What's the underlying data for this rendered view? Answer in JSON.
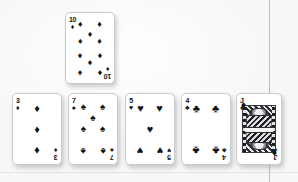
{
  "scene": {
    "description": "Playing cards laid out on a light surface",
    "background_color": "#fdfdfd",
    "guide_line_color": "#b9bcc0"
  },
  "suit_glyphs": {
    "diamonds": "♦",
    "spades": "♠",
    "hearts": "♥",
    "clubs": "♣"
  },
  "cards": [
    {
      "id": "card-top-10-diamonds",
      "rank": "10",
      "suit": "diamonds",
      "suit_symbol": "♦",
      "color": "#121316",
      "row": "top",
      "position": {
        "x": 65,
        "y": 12,
        "w": 50,
        "h": 72
      },
      "pip_layout": "10",
      "is_court": false
    },
    {
      "id": "card-bottom-3-diamonds",
      "rank": "3",
      "suit": "diamonds",
      "suit_symbol": "♦",
      "color": "#121316",
      "row": "bottom",
      "position": {
        "x": 12,
        "y": 93,
        "w": 50,
        "h": 72
      },
      "pip_layout": "3",
      "is_court": false
    },
    {
      "id": "card-bottom-7-spades",
      "rank": "7",
      "suit": "spades",
      "suit_symbol": "♠",
      "color": "#111214",
      "row": "bottom",
      "position": {
        "x": 68,
        "y": 93,
        "w": 50,
        "h": 72
      },
      "pip_layout": "7",
      "is_court": false
    },
    {
      "id": "card-bottom-5-hearts",
      "rank": "5",
      "suit": "hearts",
      "suit_symbol": "♥",
      "color": "#121316",
      "row": "bottom",
      "position": {
        "x": 125,
        "y": 93,
        "w": 50,
        "h": 72
      },
      "pip_layout": "5",
      "is_court": false
    },
    {
      "id": "card-bottom-4-clubs",
      "rank": "4",
      "suit": "clubs",
      "suit_symbol": "♣",
      "color": "#111214",
      "row": "bottom",
      "position": {
        "x": 181,
        "y": 93,
        "w": 50,
        "h": 72
      },
      "pip_layout": "4",
      "is_court": false
    },
    {
      "id": "card-bottom-jack-diamonds",
      "rank": "J",
      "suit": "diamonds",
      "suit_symbol": "♦",
      "color": "#121316",
      "row": "bottom",
      "position": {
        "x": 236,
        "y": 93,
        "w": 46,
        "h": 72
      },
      "pip_layout": "court",
      "is_court": true
    }
  ],
  "guides": {
    "vertical_line_x": 269,
    "horizontal_line_y": 172
  },
  "pip_positions": {
    "3": [
      [
        50,
        20
      ],
      [
        50,
        50
      ],
      [
        50,
        80
      ]
    ],
    "4": [
      [
        30,
        20
      ],
      [
        70,
        20
      ],
      [
        30,
        80
      ],
      [
        70,
        80
      ]
    ],
    "5": [
      [
        30,
        20
      ],
      [
        70,
        20
      ],
      [
        50,
        50
      ],
      [
        30,
        80
      ],
      [
        70,
        80
      ]
    ],
    "7": [
      [
        30,
        18
      ],
      [
        70,
        18
      ],
      [
        50,
        34
      ],
      [
        30,
        50
      ],
      [
        70,
        50
      ],
      [
        30,
        82
      ],
      [
        70,
        82
      ]
    ],
    "10": [
      [
        30,
        16
      ],
      [
        70,
        16
      ],
      [
        50,
        30
      ],
      [
        30,
        40
      ],
      [
        70,
        40
      ],
      [
        30,
        60
      ],
      [
        70,
        60
      ],
      [
        50,
        70
      ],
      [
        30,
        84
      ],
      [
        70,
        84
      ]
    ]
  },
  "flipped_pip_index": {
    "3": [
      2
    ],
    "4": [
      2,
      3
    ],
    "5": [
      3,
      4
    ],
    "7": [
      5,
      6
    ],
    "10": [
      5,
      6,
      7,
      8,
      9
    ]
  }
}
